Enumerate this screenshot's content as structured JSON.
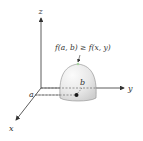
{
  "diagram": {
    "title_expression": "f(a, b) ≥ f(x, y)",
    "axes": {
      "x_label": "x",
      "y_label": "y",
      "z_label": "z"
    },
    "point_labels": {
      "a_label": "a",
      "b_label": "b"
    },
    "colors": {
      "axis": "#333333",
      "dome_fill": "#e6e6e6",
      "dome_highlight": "#f7f7f7",
      "dome_stroke": "#888888",
      "point": "#1a1a1a",
      "leader_top": "#a8d5a2"
    }
  }
}
